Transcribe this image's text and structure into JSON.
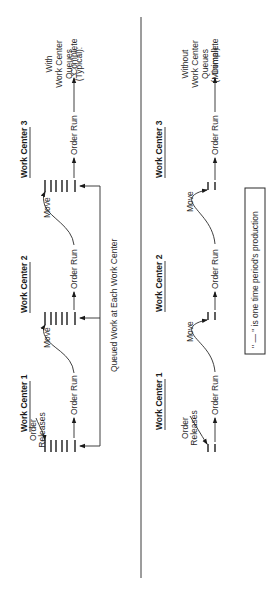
{
  "diagram": {
    "colors": {
      "ink": "#2a2a2a",
      "background": "#ffffff"
    },
    "legend": "\" — \" is one time period's production",
    "sections": [
      {
        "id": "with-queues",
        "label_lines": [
          "With",
          "Work Center",
          "Queues",
          "(Typical):"
        ],
        "order_releases": [
          "Order",
          "Releases"
        ],
        "queue_bars": 6,
        "feedback_label": "Queued Work at Each Work Center",
        "work_centers": [
          {
            "title": "Work Center 1",
            "run_label": "Order Run"
          },
          {
            "title": "Work Center 2",
            "run_label": "Order Run",
            "move_label": "Move"
          },
          {
            "title": "Work Center 3",
            "run_label": "Order Run",
            "move_label": "Move"
          }
        ],
        "end_label": "Complete"
      },
      {
        "id": "without-queues",
        "label_lines": [
          "Without",
          "Work Center",
          "Queues",
          "(Minimal):"
        ],
        "order_releases": [
          "Order",
          "Releases"
        ],
        "queue_bars": 2,
        "work_centers": [
          {
            "title": "Work Center 1",
            "run_label": "Order Run"
          },
          {
            "title": "Work Center 2",
            "run_label": "Order Run",
            "move_label": "Move"
          },
          {
            "title": "Work Center 3",
            "run_label": "Order Run",
            "move_label": "Move"
          }
        ],
        "end_label": "Complete"
      }
    ]
  }
}
